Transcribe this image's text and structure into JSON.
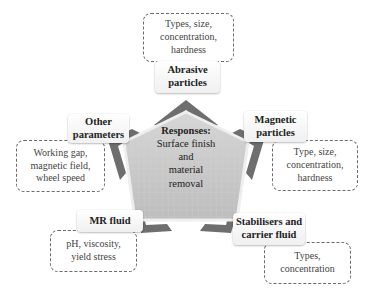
{
  "center": {
    "heading": "Responses:",
    "line1": "Surface finish",
    "line2": "and",
    "line3": "material",
    "line4": "removal"
  },
  "factors": [
    {
      "id": "abrasive",
      "label_line1": "Abrasive",
      "label_line2": "particles",
      "details": [
        "Types, size,",
        "concentration,",
        "hardness"
      ]
    },
    {
      "id": "magnetic",
      "label_line1": "Magnetic",
      "label_line2": "particles",
      "details": [
        "Type, size,",
        "concentration,",
        "hardness"
      ]
    },
    {
      "id": "stabilisers",
      "label_line1": "Stabilisers and",
      "label_line2": "carrier fluid",
      "details": [
        "Types,",
        "concentration"
      ]
    },
    {
      "id": "mr-fluid",
      "label_line1": "MR fluid",
      "label_line2": "",
      "details": [
        "pH, viscosity,",
        "yield stress"
      ]
    },
    {
      "id": "other",
      "label_line1": "Other",
      "label_line2": "parameters",
      "details": [
        "Working gap,",
        "magnetic field,",
        "wheel speed"
      ]
    }
  ],
  "colors": {
    "pentagon_fill": "#c9c9c9",
    "pentagon_border": "#e8e8e8",
    "chevron_dark": "#6b6b6b",
    "chevron_light": "#9a9a9a",
    "dashed_border": "#6a6a6a"
  }
}
